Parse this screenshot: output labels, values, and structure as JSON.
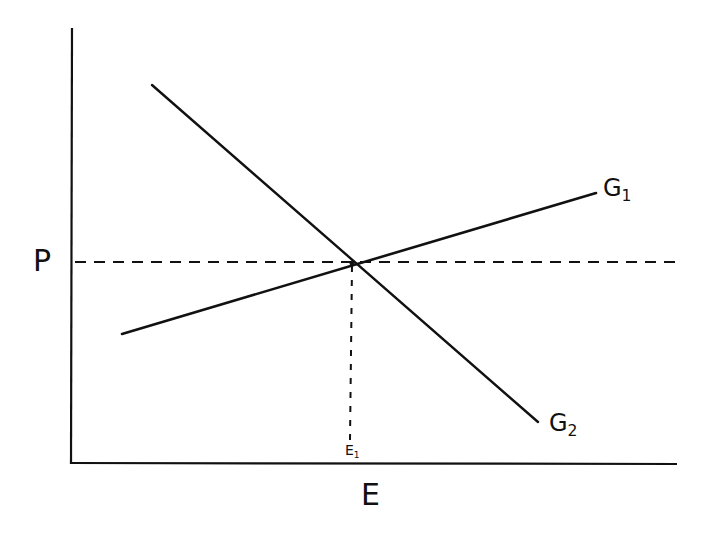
{
  "diagram": {
    "type": "economic-line-diagram",
    "colors": {
      "ink": "#111111",
      "background": "#ffffff"
    },
    "axes": {
      "y_label": "P",
      "x_label": "E",
      "origin": [
        72,
        463
      ],
      "y_axis_top": [
        72,
        28
      ],
      "x_axis_right": [
        677,
        463
      ]
    },
    "lines": [
      {
        "name": "G1",
        "label_main": "G",
        "label_sub": "1",
        "from": [
          122,
          333
        ],
        "to": [
          596,
          193
        ],
        "slope": "upward"
      },
      {
        "name": "G2",
        "label_main": "G",
        "label_sub": "2",
        "from": [
          152,
          85
        ],
        "to": [
          538,
          422
        ],
        "slope": "downward"
      }
    ],
    "reference_lines": {
      "horizontal_price": {
        "y": 262,
        "from_x": 74,
        "to_x": 676,
        "style": "dashed"
      },
      "vertical_equilibrium": {
        "x": 351,
        "from_y": 264,
        "to_y": 440,
        "style": "dashed"
      }
    },
    "intersection": {
      "point": [
        352,
        263
      ],
      "x_label": "E1",
      "x_label_main": "E",
      "x_label_sub": "1"
    }
  }
}
